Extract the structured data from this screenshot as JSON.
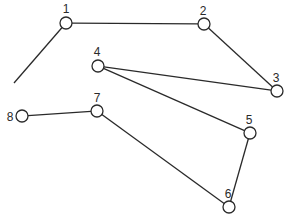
{
  "diagram": {
    "title": "",
    "node_radius": 6,
    "nodes": [
      {
        "id": "1",
        "label": "1",
        "x": 66,
        "y": 23,
        "lx": 66,
        "ly": 13
      },
      {
        "id": "2",
        "label": "2",
        "x": 204,
        "y": 24,
        "lx": 203,
        "ly": 15
      },
      {
        "id": "3",
        "label": "3",
        "x": 277,
        "y": 91,
        "lx": 276,
        "ly": 82
      },
      {
        "id": "4",
        "label": "4",
        "x": 98,
        "y": 66,
        "lx": 97,
        "ly": 56
      },
      {
        "id": "5",
        "label": "5",
        "x": 250,
        "y": 133,
        "lx": 249,
        "ly": 124
      },
      {
        "id": "6",
        "label": "6",
        "x": 229,
        "y": 207,
        "lx": 228,
        "ly": 198
      },
      {
        "id": "7",
        "label": "7",
        "x": 97,
        "y": 111,
        "lx": 97,
        "ly": 102
      },
      {
        "id": "8",
        "label": "8",
        "x": 22,
        "y": 116,
        "lx": 10,
        "ly": 121
      }
    ],
    "edges": [
      {
        "from": "1",
        "to": "2"
      },
      {
        "from": "2",
        "to": "3"
      },
      {
        "from": "3",
        "to": "4"
      },
      {
        "from": "4",
        "to": "5"
      },
      {
        "from": "5",
        "to": "6"
      },
      {
        "from": "6",
        "to": "7"
      },
      {
        "from": "7",
        "to": "8"
      }
    ],
    "dangling_edge": {
      "from": "1",
      "x2": 14,
      "y2": 83
    },
    "colors": {
      "stroke": "#2a2a2a",
      "background": "#ffffff"
    }
  }
}
